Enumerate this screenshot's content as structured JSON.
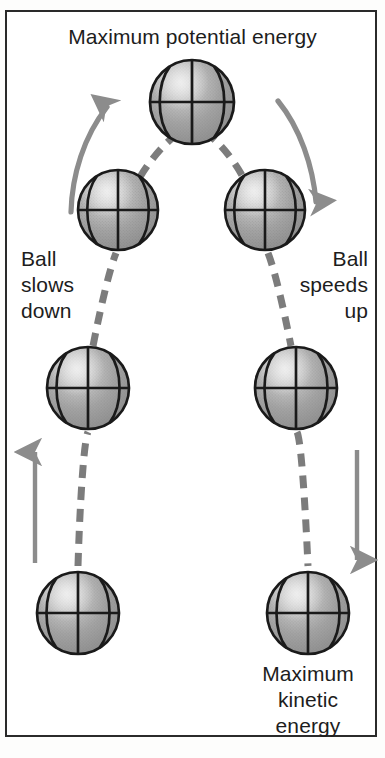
{
  "diagram": {
    "labels": {
      "top": "Maximum potential energy",
      "left": "Ball\nslows\ndown",
      "right": "Ball\nspeeds\nup",
      "bottom": "Maximum\nkinetic\nenergy"
    },
    "colors": {
      "border": "#2a2a2a",
      "background": "#ffffff",
      "text": "#1d1d1d",
      "ball_fill": "#9a9a9a",
      "ball_highlight": "#d6d6d6",
      "ball_outline": "#1a1a1a",
      "trajectory": "#7c7c7c",
      "arrow": "#8c8c8c"
    },
    "balls": [
      {
        "name": "ball-bottom-left",
        "cx": 78,
        "cy": 613,
        "r": 41,
        "stage": 1,
        "side": "left"
      },
      {
        "name": "ball-mid-left",
        "cx": 88,
        "cy": 388,
        "r": 41,
        "stage": 2,
        "side": "left"
      },
      {
        "name": "ball-upper-left",
        "cx": 118,
        "cy": 210,
        "r": 40,
        "stage": 3,
        "side": "left"
      },
      {
        "name": "ball-apex",
        "cx": 192,
        "cy": 102,
        "r": 42,
        "stage": 4,
        "side": "apex"
      },
      {
        "name": "ball-upper-right",
        "cx": 265,
        "cy": 210,
        "r": 40,
        "stage": 5,
        "side": "right"
      },
      {
        "name": "ball-mid-right",
        "cx": 296,
        "cy": 388,
        "r": 41,
        "stage": 6,
        "side": "right"
      },
      {
        "name": "ball-bottom-right",
        "cx": 308,
        "cy": 613,
        "r": 41,
        "stage": 7,
        "side": "right"
      }
    ],
    "trajectory": {
      "style": "dashed",
      "dash_pattern": "13 9",
      "stroke_width": 7
    },
    "arrows": [
      {
        "name": "arrow-ascending-upper-left",
        "direction": "up-right",
        "shape": "curved"
      },
      {
        "name": "arrow-descending-upper-right",
        "direction": "down-right",
        "shape": "curved"
      },
      {
        "name": "arrow-ascending-lower-left",
        "direction": "up",
        "shape": "straight"
      },
      {
        "name": "arrow-descending-lower-right",
        "direction": "down",
        "shape": "straight"
      }
    ]
  }
}
